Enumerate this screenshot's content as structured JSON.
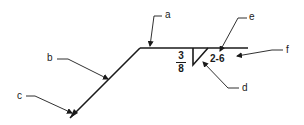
{
  "diagram": {
    "type": "welding-symbol",
    "labels": {
      "a": "a",
      "b": "b",
      "c": "c",
      "d": "d",
      "e": "e",
      "f": "f"
    },
    "weld_size": {
      "numerator": "3",
      "denominator": "8"
    },
    "length_pitch": "2-6",
    "colors": {
      "line": "#1a1a1a",
      "background": "#ffffff"
    }
  }
}
